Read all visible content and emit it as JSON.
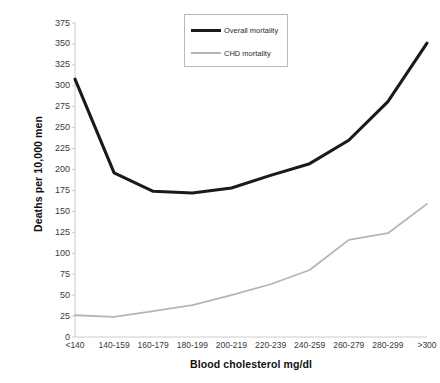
{
  "chart_data": {
    "type": "line",
    "title": "",
    "xlabel": "Blood cholesterol mg/dl",
    "ylabel": "Deaths per 10,000 men",
    "categories": [
      "<140",
      "140-159",
      "160-179",
      "180-199",
      "200-219",
      "220-239",
      "240-259",
      "260-279",
      "280-299",
      ">300"
    ],
    "series": [
      {
        "name": "Overall mortality",
        "color": "#1a1a1a",
        "style": "solid-thick",
        "values": [
          308,
          196,
          174,
          172,
          178,
          193,
          207,
          235,
          281,
          351
        ]
      },
      {
        "name": "CHD mortality",
        "color": "#b5b5b5",
        "style": "solid-thin",
        "values": [
          26,
          24,
          31,
          38,
          50,
          63,
          80,
          116,
          124,
          159
        ]
      }
    ],
    "ylim": [
      0,
      375
    ],
    "ytick_step": 25,
    "yticks": [
      0,
      25,
      50,
      75,
      100,
      125,
      150,
      175,
      200,
      225,
      250,
      275,
      300,
      325,
      350,
      375
    ],
    "grid": false,
    "legend_position": "top-center",
    "axis_color": "#cccccc"
  },
  "legend": {
    "items": [
      {
        "label": "Overall mortality"
      },
      {
        "label": "CHD mortality"
      }
    ]
  },
  "axes": {
    "y_title": "Deaths per 10,000 men",
    "x_title": "Blood cholesterol mg/dl"
  }
}
